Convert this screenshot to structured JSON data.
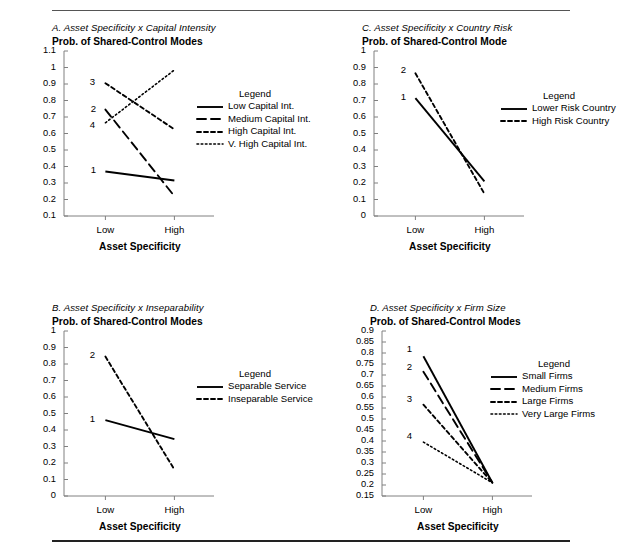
{
  "figure": {
    "rule_top": true,
    "rule_bottom": true,
    "background": "#ffffff",
    "line_color": "#000000",
    "axis_color": "#808080"
  },
  "chart_data": [
    {
      "id": "A",
      "type": "line",
      "title": "A. Asset Specificity x Capital Intensity",
      "subtitle": "Prob. of Shared-Control Modes",
      "xlabel": "Asset Specificity",
      "ylabel": "",
      "categories": [
        "Low",
        "High"
      ],
      "yticks": [
        "1.1",
        "1",
        "0.9",
        "0.8",
        "0.7",
        "0.6",
        "0.5",
        "0.4",
        "0.3",
        "0.2",
        "0.1"
      ],
      "ylim": [
        0.1,
        1.1
      ],
      "grid": false,
      "legend_position": "right",
      "legend_title": "Legend",
      "series": [
        {
          "num": "1",
          "name": "Low Capital Int.",
          "style": "solid",
          "values": [
            0.37,
            0.315
          ]
        },
        {
          "num": "2",
          "name": "Medium Capital Int.",
          "style": "dashed",
          "values": [
            0.745,
            0.22
          ]
        },
        {
          "num": "3",
          "name": "High Capital Int.",
          "style": "dotted",
          "values": [
            0.905,
            0.625
          ]
        },
        {
          "num": "4",
          "name": "V. High Capital Int.",
          "style": "fine-dotted",
          "values": [
            0.665,
            0.985
          ]
        }
      ]
    },
    {
      "id": "C",
      "type": "line",
      "title": "C. Asset Specificity x Country Risk",
      "subtitle": "Prob. of Shared-Control Mode",
      "xlabel": "Asset Specificity",
      "ylabel": "",
      "categories": [
        "Low",
        "High"
      ],
      "yticks": [
        "1",
        "0.9",
        "0.8",
        "0.7",
        "0.6",
        "0.5",
        "0.4",
        "0.3",
        "0.2",
        "0.1",
        "0"
      ],
      "ylim": [
        0,
        1
      ],
      "grid": false,
      "legend_position": "right",
      "legend_title": "Legend",
      "series": [
        {
          "num": "1",
          "name": "Lower Risk Country",
          "style": "solid",
          "values": [
            0.715,
            0.21
          ]
        },
        {
          "num": "2",
          "name": "High Risk Country",
          "style": "dotted",
          "values": [
            0.865,
            0.135
          ]
        }
      ]
    },
    {
      "id": "B",
      "type": "line",
      "title": "B. Asset Specificity x Inseparability",
      "subtitle": "Prob. of Shared-Control Modes",
      "xlabel": "Asset Specificity",
      "ylabel": "",
      "categories": [
        "Low",
        "High"
      ],
      "yticks": [
        "1",
        "0.9",
        "0.8",
        "0.7",
        "0.6",
        "0.5",
        "0.4",
        "0.3",
        "0.2",
        "0.1",
        "0"
      ],
      "ylim": [
        0,
        1
      ],
      "grid": false,
      "legend_position": "right",
      "legend_title": "Legend",
      "series": [
        {
          "num": "1",
          "name": "Separable Service",
          "style": "solid",
          "values": [
            0.46,
            0.345
          ]
        },
        {
          "num": "2",
          "name": "Inseparable Service",
          "style": "dotted",
          "values": [
            0.845,
            0.16
          ]
        }
      ]
    },
    {
      "id": "D",
      "type": "line",
      "title": "D. Asset Specificity x Firm Size",
      "subtitle": "Prob. of Shared-Control Modes",
      "xlabel": "Asset Specificity",
      "ylabel": "",
      "categories": [
        "Low",
        "High"
      ],
      "yticks": [
        "0.9",
        "0.85",
        "0.8",
        "0.75",
        "0.7",
        "0.65",
        "0.6",
        "0.55",
        "0.5",
        "0.45",
        "0.4",
        "0.35",
        "0.3",
        "0.25",
        "0.2",
        "0.15"
      ],
      "ylim": [
        0.15,
        0.9
      ],
      "grid": false,
      "legend_position": "right",
      "legend_title": "Legend",
      "series": [
        {
          "num": "1",
          "name": "Small Firms",
          "style": "solid",
          "values": [
            0.785,
            0.21
          ]
        },
        {
          "num": "2",
          "name": "Medium Firms",
          "style": "dashed",
          "values": [
            0.715,
            0.21
          ]
        },
        {
          "num": "3",
          "name": "Large Firms",
          "style": "dotted",
          "values": [
            0.565,
            0.21
          ]
        },
        {
          "num": "4",
          "name": "Very Large Firms",
          "style": "fine-dotted",
          "values": [
            0.395,
            0.21
          ]
        }
      ]
    }
  ]
}
